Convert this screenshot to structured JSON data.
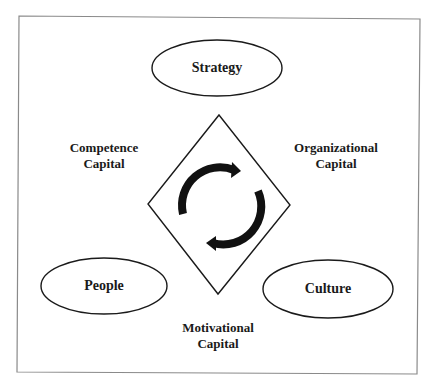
{
  "diagram": {
    "colors": {
      "background": "#ffffff",
      "frame": "#8a8a8a",
      "stroke": "#1a1a1a",
      "text": "#1a1a1a"
    },
    "nodes": [
      {
        "id": "strategy",
        "label": "Strategy",
        "cx": 217,
        "cy": 68,
        "rx": 65,
        "ry": 28
      },
      {
        "id": "people",
        "label": "People",
        "cx": 104,
        "cy": 286,
        "rx": 63,
        "ry": 28
      },
      {
        "id": "culture",
        "label": "Culture",
        "cx": 328,
        "cy": 289,
        "rx": 65,
        "ry": 29
      }
    ],
    "capitals": [
      {
        "id": "competence",
        "line1": "Competence",
        "line2": "Capital",
        "x": 104,
        "y": 140
      },
      {
        "id": "organizational",
        "line1": "Organizational",
        "line2": "Capital",
        "x": 336,
        "y": 140
      },
      {
        "id": "motivational",
        "line1": "Motivational",
        "line2": "Capital",
        "x": 218,
        "y": 320
      }
    ],
    "center": {
      "shape": "diamond",
      "top": [
        219,
        115
      ],
      "right": [
        290,
        205
      ],
      "bottom": [
        218,
        294
      ],
      "left": [
        148,
        204
      ],
      "icon": "cycle-arrows-icon"
    }
  }
}
